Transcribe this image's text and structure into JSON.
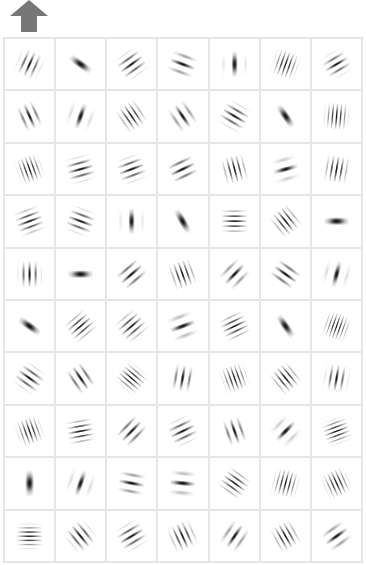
{
  "toolbar": {
    "up_button": {
      "icon": "up-arrow-icon",
      "color": "#777777"
    }
  },
  "grid": {
    "rows": 10,
    "cols": 7,
    "line_color": "#e6e6e6",
    "cells": [
      [
        {
          "a": 25,
          "n": 4,
          "s": 0.55
        },
        {
          "a": -55,
          "n": 1.6,
          "s": 0.5
        },
        {
          "a": 55,
          "n": 4,
          "s": 0.6
        },
        {
          "a": -70,
          "n": 3,
          "s": 0.55
        },
        {
          "a": 0,
          "n": 2,
          "s": 0.5
        },
        {
          "a": 20,
          "n": 6,
          "s": 0.6
        },
        {
          "a": 60,
          "n": 4,
          "s": 0.55
        }
      ],
      [
        {
          "a": -25,
          "n": 3.5,
          "s": 0.55
        },
        {
          "a": 20,
          "n": 2.2,
          "s": 0.5
        },
        {
          "a": -35,
          "n": 5,
          "s": 0.6
        },
        {
          "a": -35,
          "n": 3,
          "s": 0.55
        },
        {
          "a": -60,
          "n": 4,
          "s": 0.6
        },
        {
          "a": -35,
          "n": 1.6,
          "s": 0.5
        },
        {
          "a": 5,
          "n": 6,
          "s": 0.6
        }
      ],
      [
        {
          "a": -20,
          "n": 6,
          "s": 0.6
        },
        {
          "a": 75,
          "n": 4,
          "s": 0.6
        },
        {
          "a": 70,
          "n": 4,
          "s": 0.6
        },
        {
          "a": 65,
          "n": 3.5,
          "s": 0.6
        },
        {
          "a": -15,
          "n": 5,
          "s": 0.6
        },
        {
          "a": 75,
          "n": 2.5,
          "s": 0.5
        },
        {
          "a": 10,
          "n": 5,
          "s": 0.6
        }
      ],
      [
        {
          "a": 70,
          "n": 4.5,
          "s": 0.6
        },
        {
          "a": -70,
          "n": 4,
          "s": 0.6
        },
        {
          "a": 0,
          "n": 2,
          "s": 0.5
        },
        {
          "a": -30,
          "n": 1.6,
          "s": 0.5
        },
        {
          "a": 90,
          "n": 5,
          "s": 0.6
        },
        {
          "a": -40,
          "n": 5,
          "s": 0.6
        },
        {
          "a": 90,
          "n": 1.6,
          "s": 0.5
        }
      ],
      [
        {
          "a": 0,
          "n": 4,
          "s": 0.55
        },
        {
          "a": 90,
          "n": 1.6,
          "s": 0.5
        },
        {
          "a": 50,
          "n": 3.5,
          "s": 0.6
        },
        {
          "a": -20,
          "n": 5,
          "s": 0.6
        },
        {
          "a": 45,
          "n": 3,
          "s": 0.55
        },
        {
          "a": -55,
          "n": 3.5,
          "s": 0.6
        },
        {
          "a": 15,
          "n": 2.2,
          "s": 0.5
        }
      ],
      [
        {
          "a": -55,
          "n": 1.6,
          "s": 0.5
        },
        {
          "a": 50,
          "n": 5,
          "s": 0.6
        },
        {
          "a": 50,
          "n": 4.5,
          "s": 0.6
        },
        {
          "a": 70,
          "n": 2.5,
          "s": 0.55
        },
        {
          "a": 65,
          "n": 5,
          "s": 0.6
        },
        {
          "a": -35,
          "n": 1.6,
          "s": 0.5
        },
        {
          "a": 20,
          "n": 7,
          "s": 0.6
        }
      ],
      [
        {
          "a": -55,
          "n": 4,
          "s": 0.6
        },
        {
          "a": -35,
          "n": 3.5,
          "s": 0.6
        },
        {
          "a": -50,
          "n": 6,
          "s": 0.6
        },
        {
          "a": 10,
          "n": 3.5,
          "s": 0.55
        },
        {
          "a": -20,
          "n": 6,
          "s": 0.6
        },
        {
          "a": -40,
          "n": 5,
          "s": 0.6
        },
        {
          "a": 10,
          "n": 4,
          "s": 0.55
        }
      ],
      [
        {
          "a": -20,
          "n": 6,
          "s": 0.6
        },
        {
          "a": 80,
          "n": 5,
          "s": 0.6
        },
        {
          "a": 45,
          "n": 3.5,
          "s": 0.6
        },
        {
          "a": 65,
          "n": 4,
          "s": 0.6
        },
        {
          "a": -20,
          "n": 3.5,
          "s": 0.55
        },
        {
          "a": 45,
          "n": 2.5,
          "s": 0.5
        },
        {
          "a": 70,
          "n": 6,
          "s": 0.6
        }
      ],
      [
        {
          "a": 0,
          "n": 1.4,
          "s": 0.5
        },
        {
          "a": 20,
          "n": 2.2,
          "s": 0.5
        },
        {
          "a": -80,
          "n": 3,
          "s": 0.55
        },
        {
          "a": -85,
          "n": 2.5,
          "s": 0.55
        },
        {
          "a": -55,
          "n": 5,
          "s": 0.6
        },
        {
          "a": 15,
          "n": 6,
          "s": 0.6
        },
        {
          "a": -25,
          "n": 6,
          "s": 0.6
        }
      ],
      [
        {
          "a": 90,
          "n": 6,
          "s": 0.6
        },
        {
          "a": -40,
          "n": 4,
          "s": 0.6
        },
        {
          "a": 60,
          "n": 4,
          "s": 0.6
        },
        {
          "a": -25,
          "n": 4.5,
          "s": 0.6
        },
        {
          "a": 35,
          "n": 3,
          "s": 0.55
        },
        {
          "a": -30,
          "n": 5,
          "s": 0.6
        },
        {
          "a": 55,
          "n": 3,
          "s": 0.55
        }
      ]
    ]
  }
}
